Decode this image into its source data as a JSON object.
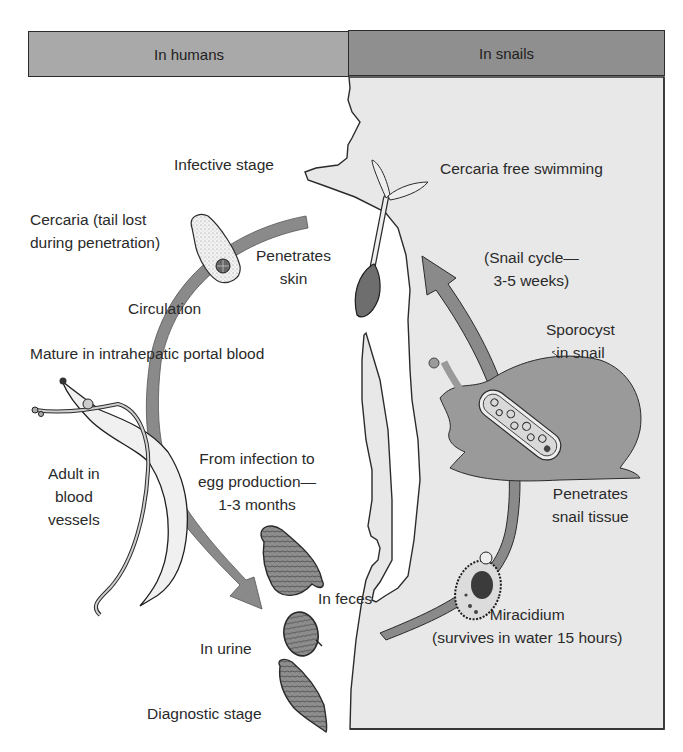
{
  "header": {
    "left_title": "In humans",
    "right_title": "In snails"
  },
  "labels": {
    "infective_stage": "Infective stage",
    "cercaria_free_swimming": "Cercaria free swimming",
    "cercaria_tail_lost_line1": "Cercaria (tail lost",
    "cercaria_tail_lost_line2": "during penetration)",
    "penetrates_skin_line1": "Penetrates",
    "penetrates_skin_line2": "skin",
    "snail_cycle_line1": "(Snail cycle—",
    "snail_cycle_line2": "3-5 weeks)",
    "circulation": "Circulation",
    "sporocyst_line1": "Sporocyst",
    "sporocyst_line2": "in snail",
    "mature": "Mature in intrahepatic portal blood",
    "adult_line1": "Adult in",
    "adult_line2": "blood",
    "adult_line3": "vessels",
    "infection_to_egg_line1": "From infection to",
    "infection_to_egg_line2": "egg production—",
    "infection_to_egg_line3": "1-3 months",
    "penetrates_snail_line1": "Penetrates",
    "penetrates_snail_line2": "snail tissue",
    "in_feces": "In feces",
    "in_urine": "In urine",
    "miracidium_line1": "Miracidium",
    "miracidium_line2": "(survives in water 15 hours)",
    "diagnostic_stage": "Diagnostic stage"
  },
  "colors": {
    "header_left": "#a9a9a9",
    "header_right": "#8f8f8f",
    "snail_panel": "#e8e8e8",
    "arrow": "#8a8a8a",
    "snail_body": "#9a9a9a",
    "outline": "#2b2b2b"
  },
  "icons": {
    "arrows": [
      "human-cycle-arrow",
      "snail-cycle-arrow",
      "miracidium-path"
    ],
    "organisms": [
      "cercaria-swimming",
      "cercaria-tailless",
      "adult-worms",
      "egg-feces",
      "egg-urine",
      "egg-diagnostic",
      "sporocyst",
      "miracidium",
      "snail",
      "human-silhouette"
    ]
  }
}
